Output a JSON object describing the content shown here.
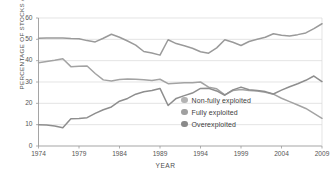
{
  "chart_data": {
    "type": "line",
    "title": "",
    "xlabel": "YEAR",
    "ylabel": "PERCENTAGE OF STOCKS ASSESSED",
    "xlim": [
      1974,
      2009
    ],
    "ylim": [
      0,
      60
    ],
    "yticks": [
      0,
      10,
      20,
      30,
      40,
      50,
      60
    ],
    "xticks": [
      1974,
      1979,
      1984,
      1989,
      1994,
      1999,
      2004,
      2009
    ],
    "grid": "horizontal-light",
    "legend_position": "inside-center-right",
    "x": [
      1974,
      1975,
      1976,
      1977,
      1978,
      1979,
      1980,
      1981,
      1982,
      1983,
      1984,
      1985,
      1986,
      1987,
      1988,
      1989,
      1990,
      1991,
      1992,
      1993,
      1994,
      1995,
      1996,
      1997,
      1998,
      1999,
      2000,
      2001,
      2002,
      2003,
      2004,
      2005,
      2006,
      2007,
      2008,
      2009
    ],
    "series": [
      {
        "name": "Fully exploited",
        "color": "#9a9a9a",
        "values": [
          50.5,
          50.6,
          50.6,
          50.6,
          50.4,
          50.3,
          49.4,
          48.8,
          50.5,
          52.4,
          51.0,
          49.2,
          47.3,
          44.3,
          43.6,
          42.6,
          49.8,
          48.0,
          47.0,
          45.8,
          44.2,
          43.5,
          46.0,
          49.8,
          48.6,
          47.1,
          49.0,
          50.0,
          51.0,
          52.6,
          51.9,
          51.6,
          52.2,
          53.0,
          55.0,
          57.3
        ]
      },
      {
        "name": "Non-fully exploited",
        "color": "#a3a3a3",
        "values": [
          39.0,
          39.6,
          40.2,
          40.9,
          37.2,
          37.4,
          37.5,
          34.0,
          31.0,
          30.5,
          31.2,
          31.4,
          31.3,
          31.1,
          30.7,
          31.3,
          29.2,
          29.4,
          29.6,
          29.7,
          30.0,
          27.6,
          26.8,
          24.0,
          26.0,
          26.5,
          26.0,
          25.8,
          25.2,
          24.3,
          22.4,
          20.8,
          19.2,
          17.6,
          15.3,
          13.0
        ]
      },
      {
        "name": "Overexploited",
        "color": "#8e8e8e",
        "values": [
          10.0,
          9.8,
          9.4,
          8.6,
          12.8,
          12.9,
          13.3,
          15.3,
          17.0,
          18.3,
          21.0,
          22.3,
          24.3,
          25.4,
          26.0,
          27.0,
          19.0,
          22.3,
          23.6,
          24.8,
          27.0,
          27.1,
          25.8,
          23.8,
          26.3,
          27.6,
          26.4,
          26.0,
          25.5,
          24.4,
          26.2,
          27.8,
          29.2,
          30.8,
          32.8,
          30.2
        ]
      }
    ],
    "legend": [
      {
        "label": "Non-fully exploited",
        "color": "#b3b3b3"
      },
      {
        "label": "Fully exploited",
        "color": "#a0a0a0"
      },
      {
        "label": "Overexploited",
        "color": "#8a8a8a"
      }
    ]
  }
}
